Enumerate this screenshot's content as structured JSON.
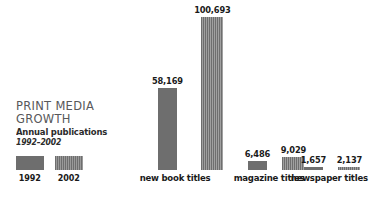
{
  "legend_block": {
    "title_line_1": "PRINT MEDIA",
    "title_line_2": "GROWTH",
    "subtitle": "Annual publications",
    "date_range": "1992–2002",
    "swatches": [
      {
        "year": "1992",
        "pattern": "solid",
        "color": "#6e6e6e"
      },
      {
        "year": "2002",
        "pattern": "striped",
        "color": "#6e6e6e"
      }
    ]
  },
  "chart_data": {
    "type": "bar",
    "title": "PRINT MEDIA GROWTH",
    "subtitle": "Annual publications",
    "xlabel": "",
    "ylabel": "",
    "grid": false,
    "legend_position": "left",
    "categories": [
      "new book titles",
      "magazine titles",
      "newspaper titles"
    ],
    "series": [
      {
        "name": "1992",
        "values": [
          58169,
          6486,
          1657
        ]
      },
      {
        "name": "2002",
        "values": [
          100693,
          9029,
          2137
        ]
      }
    ],
    "value_labels": [
      [
        "58,169",
        "100,693"
      ],
      [
        "6,486",
        "9,029"
      ],
      [
        "1,657",
        "2,137"
      ]
    ],
    "groups": [
      {
        "label": "new book titles",
        "label_left": 131,
        "label_width": 88,
        "group_left": 151,
        "bars": [
          {
            "series": "1992",
            "value": 58169,
            "label": "58,169",
            "height": 82,
            "width": 19,
            "pattern": "solid"
          },
          {
            "series": "2002",
            "value": 100693,
            "label": "100,693",
            "height": 153,
            "width": 22,
            "pattern": "striped"
          }
        ]
      },
      {
        "label": "magazine titles",
        "label_left": 231,
        "label_width": 76,
        "group_left": 244,
        "bars": [
          {
            "series": "1992",
            "value": 6486,
            "label": "6,486",
            "height": 9,
            "width": 19,
            "pattern": "solid"
          },
          {
            "series": "2002",
            "value": 9029,
            "label": "9,029",
            "height": 13,
            "width": 22,
            "pattern": "striped"
          }
        ]
      },
      {
        "label": "newspaper titles",
        "label_left": 288,
        "label_width": 80,
        "group_left": 300,
        "bars": [
          {
            "series": "1992",
            "value": 1657,
            "label": "1,657",
            "height": 3,
            "width": 19,
            "pattern": "solid"
          },
          {
            "series": "2002",
            "value": 2137,
            "label": "2,137",
            "height": 3,
            "width": 22,
            "pattern": "striped"
          }
        ]
      }
    ]
  }
}
